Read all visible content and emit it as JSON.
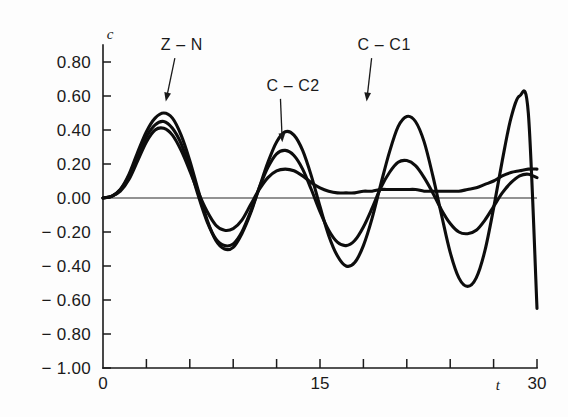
{
  "chart_data": {
    "type": "line",
    "title": "",
    "subtitle": "",
    "xlabel": "t",
    "ylabel": "c",
    "xlim": [
      0,
      30
    ],
    "ylim": [
      -1.0,
      0.9
    ],
    "grid": false,
    "legend_position": "inline-annotations",
    "x_ticks": [
      0,
      3,
      6,
      9,
      12,
      15,
      18,
      21,
      24,
      27,
      30
    ],
    "x_tick_labels": [
      "0",
      "",
      "",
      "",
      "",
      "15",
      "",
      "",
      "",
      "",
      "30"
    ],
    "y_ticks": [
      0.8,
      0.6,
      0.4,
      0.2,
      0.0,
      -0.2,
      -0.4,
      -0.6,
      -0.8,
      -1.0
    ],
    "y_tick_labels": [
      "0.80",
      "0.60",
      "0.40",
      "0.20",
      "0.00",
      "− 0.20",
      "− 0.40",
      "− 0.60",
      "− 0.80",
      "− 1.00"
    ],
    "zero_line": 0.0,
    "series": [
      {
        "name": "Z – N",
        "color": "#0d0d0d",
        "annotation_label": "Z – N",
        "x": [
          0.0,
          0.6,
          1.2,
          1.8,
          2.4,
          3.0,
          3.6,
          4.2,
          4.8,
          5.4,
          6.0,
          6.6,
          7.2,
          7.8,
          8.4,
          9.0,
          9.6,
          10.2,
          10.8,
          11.4,
          12.0,
          12.6,
          13.2,
          13.8,
          14.4,
          15.0,
          15.6,
          16.2,
          16.8,
          17.4,
          18.0,
          18.6,
          19.2,
          19.8,
          20.4,
          21.0,
          21.6,
          22.2,
          22.8,
          23.4,
          24.0,
          24.6,
          25.2,
          25.8,
          26.4,
          27.0,
          27.6,
          28.2,
          28.8,
          29.4,
          30.0
        ],
        "y": [
          0.0,
          0.01,
          0.05,
          0.14,
          0.27,
          0.39,
          0.47,
          0.5,
          0.47,
          0.37,
          0.22,
          0.04,
          -0.13,
          -0.25,
          -0.3,
          -0.29,
          -0.21,
          -0.09,
          0.06,
          0.21,
          0.33,
          0.39,
          0.37,
          0.28,
          0.13,
          -0.05,
          -0.22,
          -0.34,
          -0.4,
          -0.38,
          -0.28,
          -0.12,
          0.08,
          0.27,
          0.42,
          0.48,
          0.45,
          0.33,
          0.13,
          -0.1,
          -0.32,
          -0.47,
          -0.52,
          -0.47,
          -0.31,
          -0.06,
          0.22,
          0.47,
          0.6,
          0.5,
          -0.65
        ]
      },
      {
        "name": "C – C1",
        "color": "#0d0d0d",
        "annotation_label": "C – C1",
        "x": [
          0.0,
          0.6,
          1.2,
          1.8,
          2.4,
          3.0,
          3.6,
          4.2,
          4.8,
          5.4,
          6.0,
          6.6,
          7.2,
          7.8,
          8.4,
          9.0,
          9.6,
          10.2,
          10.8,
          11.4,
          12.0,
          12.6,
          13.2,
          13.8,
          14.4,
          15.0,
          15.6,
          16.2,
          16.8,
          17.4,
          18.0,
          18.6,
          19.2,
          19.8,
          20.4,
          21.0,
          21.6,
          22.2,
          22.8,
          23.4,
          24.0,
          24.6,
          25.2,
          25.8,
          26.4,
          27.0,
          27.6,
          28.2,
          28.8,
          29.4,
          30.0
        ],
        "y": [
          0.0,
          0.01,
          0.05,
          0.13,
          0.25,
          0.36,
          0.43,
          0.45,
          0.41,
          0.32,
          0.18,
          0.01,
          -0.14,
          -0.24,
          -0.28,
          -0.27,
          -0.2,
          -0.08,
          0.06,
          0.18,
          0.26,
          0.28,
          0.25,
          0.17,
          0.05,
          -0.08,
          -0.19,
          -0.26,
          -0.28,
          -0.25,
          -0.17,
          -0.06,
          0.06,
          0.15,
          0.21,
          0.22,
          0.19,
          0.12,
          0.03,
          -0.07,
          -0.15,
          -0.2,
          -0.21,
          -0.19,
          -0.13,
          -0.05,
          0.03,
          0.09,
          0.13,
          0.14,
          0.12
        ]
      },
      {
        "name": "C – C2",
        "color": "#0d0d0d",
        "annotation_label": "C – C2",
        "x": [
          0.0,
          0.6,
          1.2,
          1.8,
          2.4,
          3.0,
          3.6,
          4.2,
          4.8,
          5.4,
          6.0,
          6.6,
          7.2,
          7.8,
          8.4,
          9.0,
          9.6,
          10.2,
          10.8,
          11.4,
          12.0,
          12.6,
          13.2,
          13.8,
          14.4,
          15.0,
          15.6,
          16.2,
          16.8,
          17.4,
          18.0,
          18.6,
          19.2,
          19.8,
          20.4,
          21.0,
          21.6,
          22.2,
          22.8,
          23.4,
          24.0,
          24.6,
          25.2,
          25.8,
          26.4,
          27.0,
          27.6,
          28.2,
          28.8,
          29.4,
          30.0
        ],
        "y": [
          0.0,
          0.01,
          0.04,
          0.11,
          0.22,
          0.33,
          0.4,
          0.41,
          0.37,
          0.28,
          0.16,
          0.03,
          -0.08,
          -0.16,
          -0.19,
          -0.18,
          -0.13,
          -0.04,
          0.05,
          0.12,
          0.16,
          0.17,
          0.16,
          0.13,
          0.09,
          0.06,
          0.04,
          0.03,
          0.03,
          0.03,
          0.04,
          0.04,
          0.05,
          0.05,
          0.05,
          0.05,
          0.05,
          0.04,
          0.04,
          0.04,
          0.04,
          0.04,
          0.05,
          0.06,
          0.08,
          0.1,
          0.13,
          0.15,
          0.16,
          0.17,
          0.17
        ]
      }
    ],
    "annotations": [
      {
        "label": "Z – N",
        "text_x": 4.0,
        "text_y": 0.87,
        "point_x": 4.3,
        "point_y": 0.55
      },
      {
        "label": "C – C2",
        "text_x": 11.3,
        "text_y": 0.63,
        "point_x": 12.4,
        "point_y": 0.31
      },
      {
        "label": "C – C1",
        "text_x": 17.6,
        "text_y": 0.87,
        "point_x": 18.2,
        "point_y": 0.55
      }
    ]
  }
}
